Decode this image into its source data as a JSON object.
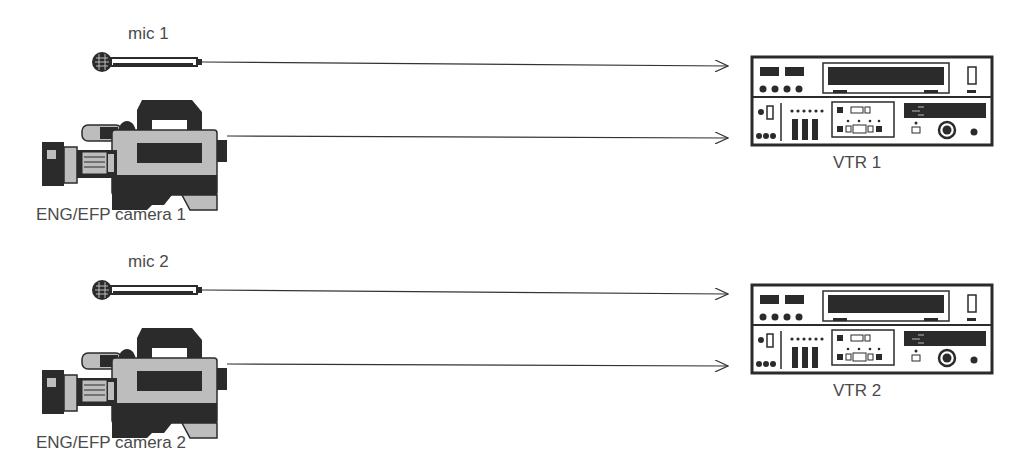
{
  "diagram": {
    "type": "single-camera-to-vtr signal flow",
    "colors": {
      "line": "#333333",
      "dark": "#2b2b2b",
      "body_gray": "#bdbdbd",
      "background": "#ffffff"
    },
    "groups": [
      {
        "mic_label": "mic 1",
        "camera_label": "ENG/EFP camera 1",
        "vtr_label": "VTR 1"
      },
      {
        "mic_label": "mic 2",
        "camera_label": "ENG/EFP camera 2",
        "vtr_label": "VTR 2"
      }
    ]
  }
}
